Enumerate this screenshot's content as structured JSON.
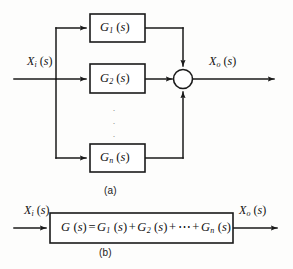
{
  "figure": {
    "background_color": "#fdfdfc",
    "line_color": "#1a1a1a"
  },
  "diagram_a": {
    "caption": "(a)",
    "input_label": {
      "var": "X",
      "sub": "i",
      "arg": "(s)",
      "full": "X i (s)"
    },
    "output_label": {
      "var": "X",
      "sub": "o",
      "arg": "(s)",
      "full": "X o (s)"
    },
    "blocks": [
      {
        "var": "G",
        "sub": "1",
        "arg": "(s)",
        "full": "G 1 (s)"
      },
      {
        "var": "G",
        "sub": "2",
        "arg": "(s)",
        "full": "G 2 (s)"
      },
      {
        "var": "G",
        "sub": "n",
        "arg": "(s)",
        "full": "G n (s)"
      }
    ],
    "vertical_ellipsis": "·",
    "summing_junction": {
      "name": "summing-junction",
      "shape": "circle",
      "inputs": 3,
      "outputs": 1
    }
  },
  "diagram_b": {
    "caption": "(b)",
    "input_label": {
      "var": "X",
      "sub": "i",
      "arg": "(s)",
      "full": "X i (s)"
    },
    "output_label": {
      "var": "X",
      "sub": "o",
      "arg": "(s)",
      "full": "X o (s)"
    },
    "equation": {
      "lhs": {
        "var": "G",
        "arg": "(s)"
      },
      "equals": "=",
      "terms": [
        {
          "var": "G",
          "sub": "1",
          "arg": "(s)"
        },
        {
          "var": "G",
          "sub": "2",
          "arg": "(s)"
        },
        {
          "var": "G",
          "sub": "n",
          "arg": "(s)"
        }
      ],
      "plus": "+",
      "ellipsis": "⋯",
      "full": "G (s) = G1 (s) + G2 (s) + ⋯ + Gn (s)"
    }
  }
}
